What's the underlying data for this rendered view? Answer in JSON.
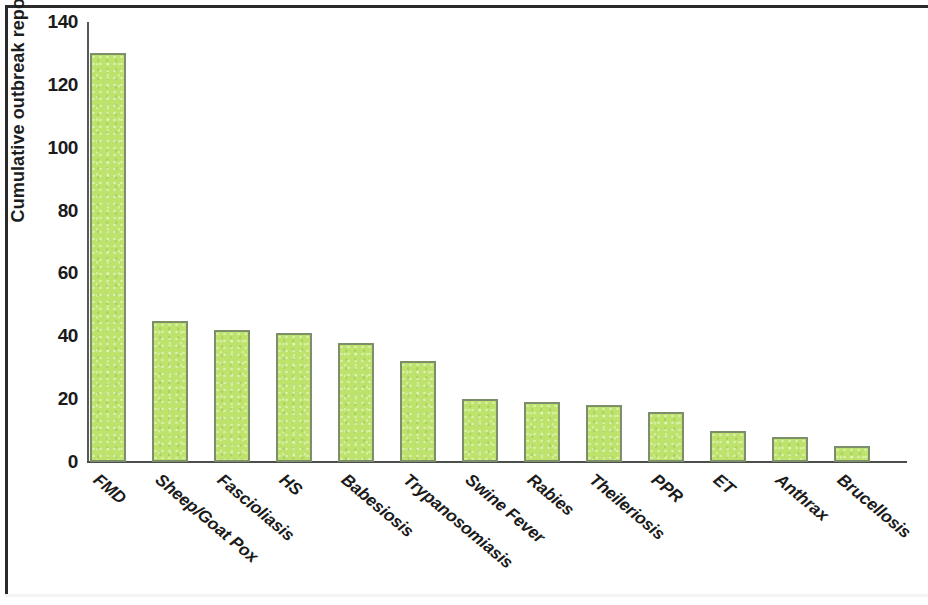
{
  "chart_data": {
    "type": "bar",
    "title": "",
    "xlabel": "",
    "ylabel": "Cumulative outbreak reports",
    "ylim": [
      0,
      140
    ],
    "yticks": [
      0,
      20,
      40,
      60,
      80,
      100,
      120,
      140
    ],
    "grid": false,
    "legend": null,
    "bar_color": "#bde36d",
    "bar_border_color": "#7d8f6a",
    "categories": [
      "FMD",
      "Sheep/Goat Pox",
      "Fascioliasis",
      "HS",
      "Babesiosis",
      "Trypanosomiasis",
      "Swine Fever",
      "Rabies",
      "Theileriosis",
      "PPR",
      "ET",
      "Anthrax",
      "Brucellosis"
    ],
    "values": [
      130,
      45,
      42,
      41,
      38,
      32,
      20,
      19,
      18,
      16,
      10,
      8,
      5
    ]
  }
}
